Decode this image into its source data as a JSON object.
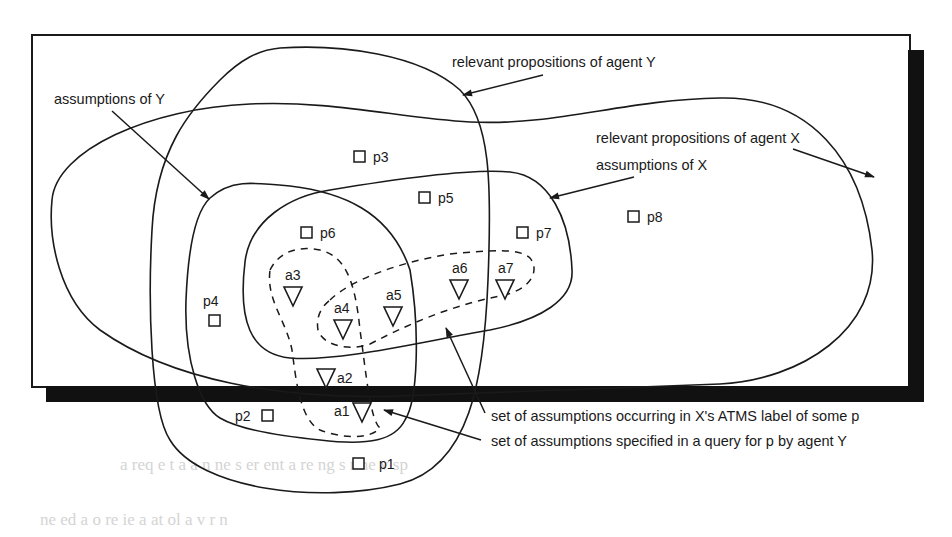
{
  "figure": {
    "callouts": {
      "relevant_props_y": "relevant propositions of agent Y",
      "assumptions_y": "assumptions of Y",
      "relevant_props_x": "relevant propositions of agent X",
      "assumptions_x": "assumptions of  X",
      "atms_label_set": "set of assumptions occurring in  X's ATMS label of some p",
      "query_set": "set of assumptions specified in a query for p by agent Y"
    },
    "propositions": [
      "p1",
      "p2",
      "p3",
      "p4",
      "p5",
      "p6",
      "p7",
      "p8"
    ],
    "assumptions": [
      "a1",
      "a2",
      "a3",
      "a4",
      "a5",
      "a6",
      "a7"
    ],
    "legend": {
      "proposition_marker": "square",
      "assumption_marker": "inverted-triangle",
      "solid_region": "set boundary",
      "dashed_region": "assumption subset"
    },
    "colors": {
      "ink": "#1a1a1a",
      "background": "#ffffff",
      "shadow": "#111111"
    }
  },
  "background_text": {
    "line1": "ne ed  a    o        re  ie      a     at   ol  a     v        r   n",
    "line2": "    a req    e  t  a  a     n  ne  s   er  ent   a   re ng  s   r  ne  v   sp"
  }
}
